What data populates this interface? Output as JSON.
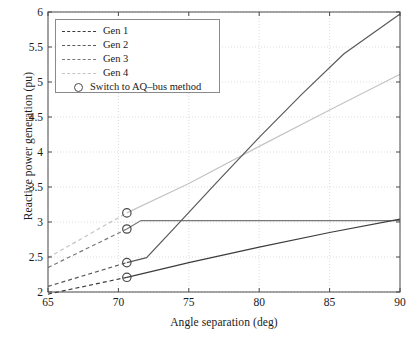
{
  "chart_data": {
    "type": "line",
    "title": "",
    "xlabel": "Angle separation (deg)",
    "ylabel": "Reactive power generation (pu)",
    "xlim": [
      65,
      90
    ],
    "ylim": [
      2,
      6
    ],
    "xticks": [
      65,
      70,
      75,
      80,
      85,
      90
    ],
    "yticks": [
      2,
      2.5,
      3,
      3.5,
      4,
      4.5,
      5,
      5.5,
      6
    ],
    "grid": "dotted",
    "legend_position": "top-left",
    "switch_angle": 70.6,
    "series": [
      {
        "name": "Gen 1",
        "color": "#3c3c3c",
        "dashed_x": [
          65,
          70.6
        ],
        "dashed_y": [
          1.97,
          2.21
        ],
        "solid_x": [
          70.6,
          75,
          80,
          85,
          90
        ],
        "solid_y": [
          2.21,
          2.42,
          2.64,
          2.85,
          3.04
        ],
        "marker_x": 70.6,
        "marker_y": 2.21
      },
      {
        "name": "Gen 2",
        "color": "#5a5a5a",
        "dashed_x": [
          65,
          70.6
        ],
        "dashed_y": [
          2.08,
          2.42
        ],
        "solid_x": [
          70.6,
          72,
          74,
          77,
          80,
          83,
          86,
          90
        ],
        "solid_y": [
          2.42,
          2.49,
          2.92,
          3.57,
          4.21,
          4.82,
          5.4,
          5.97
        ],
        "marker_x": 70.6,
        "marker_y": 2.42
      },
      {
        "name": "Gen 3",
        "color": "#787878",
        "dashed_x": [
          65,
          70.6
        ],
        "dashed_y": [
          2.35,
          2.9
        ],
        "solid_x": [
          70.6,
          71.6,
          90
        ],
        "solid_y": [
          2.9,
          3.02,
          3.02
        ],
        "marker_x": 70.6,
        "marker_y": 2.9
      },
      {
        "name": "Gen 4",
        "color": "#c4c4c4",
        "dashed_x": [
          65,
          70.6
        ],
        "dashed_y": [
          2.49,
          3.13
        ],
        "solid_x": [
          70.6,
          75,
          80,
          85,
          90
        ],
        "solid_y": [
          3.13,
          3.55,
          4.08,
          4.6,
          5.11
        ],
        "marker_x": 70.6,
        "marker_y": 3.13
      }
    ]
  },
  "legend": {
    "items": [
      {
        "label": "Gen 1",
        "type": "dashed",
        "color": "#3c3c3c"
      },
      {
        "label": "Gen 2",
        "type": "dashed",
        "color": "#5a5a5a"
      },
      {
        "label": "Gen 3",
        "type": "dashed",
        "color": "#787878"
      },
      {
        "label": "Gen 4",
        "type": "dashed",
        "color": "#c4c4c4"
      },
      {
        "label": "Switch to AQ–bus method",
        "type": "circle",
        "color": "#4a4a4a"
      }
    ]
  },
  "axes": {
    "xlabel": "Angle separation (deg)",
    "ylabel": "Reactive power generation (pu)",
    "xticklabels": [
      "65",
      "70",
      "75",
      "80",
      "85",
      "90"
    ],
    "yticklabels": [
      "2",
      "2.5",
      "3",
      "3.5",
      "4",
      "4.5",
      "5",
      "5.5",
      "6"
    ]
  },
  "colors": {
    "axis": "#4a4a4a",
    "grid": "#cfcfcf",
    "background": "#ffffff"
  }
}
